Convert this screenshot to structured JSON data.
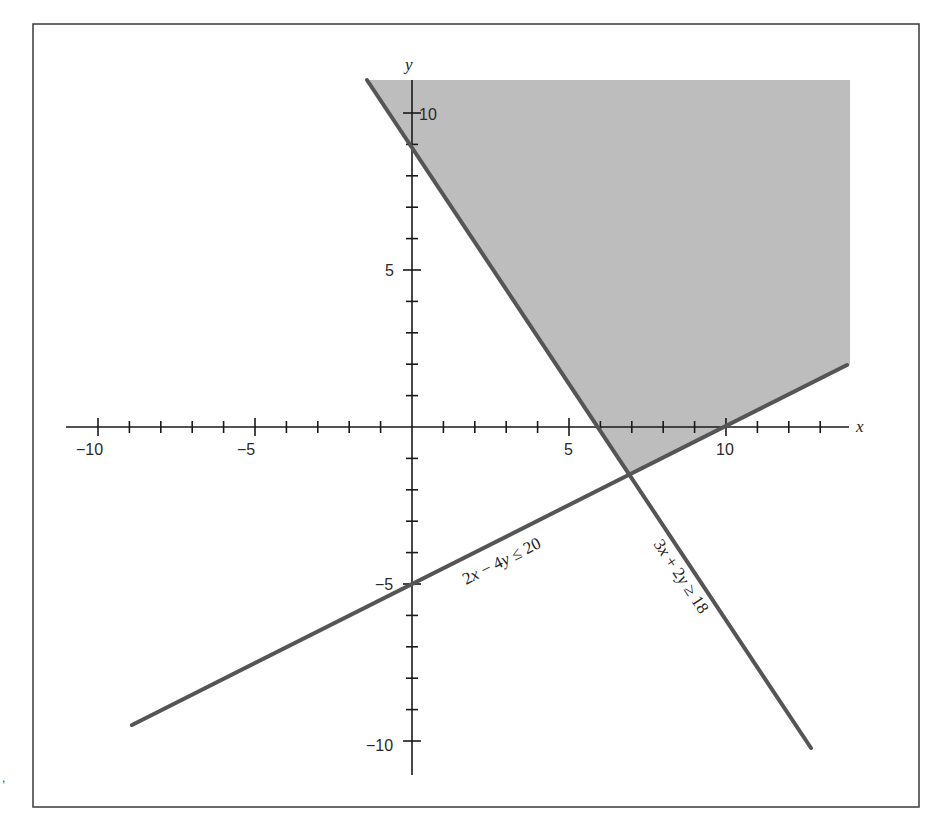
{
  "chart_data": {
    "type": "line",
    "title": "",
    "xlabel": "x",
    "ylabel": "y",
    "xlim": [
      -10.5,
      14
    ],
    "ylim": [
      -11,
      11
    ],
    "grid": false,
    "x_ticks": [
      -10,
      -9,
      -8,
      -7,
      -6,
      -5,
      -4,
      -3,
      -2,
      -1,
      1,
      2,
      3,
      4,
      5,
      6,
      7,
      8,
      9,
      10,
      11,
      12,
      13
    ],
    "y_ticks": [
      -10,
      -9,
      -8,
      -7,
      -6,
      -5,
      -4,
      -3,
      -2,
      -1,
      1,
      2,
      3,
      4,
      5,
      6,
      7,
      8,
      9,
      10
    ],
    "x_tick_labels": [
      {
        "value": -10,
        "label": "−10"
      },
      {
        "value": -5,
        "label": "−5"
      },
      {
        "value": 5,
        "label": "5"
      },
      {
        "value": 10,
        "label": "10"
      }
    ],
    "y_tick_labels": [
      {
        "value": 10,
        "label": "10"
      },
      {
        "value": 5,
        "label": "5"
      },
      {
        "value": -5,
        "label": "−5"
      },
      {
        "value": -10,
        "label": "−10"
      }
    ],
    "series": [
      {
        "name": "3x + 2y ≥ 18",
        "boundary": "3x + 2y = 18",
        "points": [
          [
            -1.43,
            11.05
          ],
          [
            12.7,
            -10.27
          ]
        ],
        "color": "#555555"
      },
      {
        "name": "2x − 4y ≤ 20",
        "boundary": "2x − 4y = 20",
        "points": [
          [
            -8.92,
            -9.46
          ],
          [
            13.85,
            1.97
          ]
        ],
        "color": "#555555"
      }
    ],
    "shaded_region": {
      "description": "feasible region satisfying both inequalities",
      "vertices": [
        [
          -1.43,
          11.05
        ],
        [
          14.0,
          11.05
        ],
        [
          14.0,
          2.0
        ],
        [
          7.0,
          -1.5
        ]
      ],
      "color": "#bdbdbd"
    },
    "intersection": [
      7,
      -1.5
    ],
    "annotations": [
      {
        "text": "2x − 4y ≤ 20",
        "near": [
          3,
          -3.5
        ],
        "rotation": -26.6
      },
      {
        "text": "3x + 2y ≥ 18",
        "near": [
          8.2,
          -5.5
        ],
        "rotation": 56.3
      }
    ]
  },
  "labels": {
    "x_axis": "x",
    "y_axis": "y",
    "eq1": {
      "a": "2",
      "v1": "x",
      "mid": " − 4",
      "v2": "y",
      "rel": " ≤ 20"
    },
    "eq2": {
      "a": "3",
      "v1": "x",
      "mid": " + 2",
      "v2": "y",
      "rel": " ≥ 18"
    }
  },
  "ticks": {
    "xm10": "−10",
    "xm5": "−5",
    "x5": "5",
    "x10": "10",
    "y10": "10",
    "y5": "5",
    "ym5": "−5",
    "ym10": "−10"
  },
  "colors": {
    "shade": "#bdbdbd",
    "line": "#555555",
    "axis": "#1a1a1a",
    "frame": "#3a3a3a"
  }
}
